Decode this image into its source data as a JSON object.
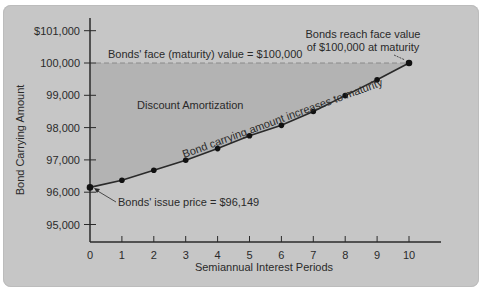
{
  "chart_data": {
    "type": "line",
    "title": "",
    "xlabel": "Semiannual Interest Periods",
    "ylabel": "Bond Carrying Amount",
    "x": [
      0,
      1,
      2,
      3,
      4,
      5,
      6,
      7,
      8,
      9,
      10
    ],
    "x_tick_labels": [
      "0",
      "1",
      "2",
      "3",
      "4",
      "5",
      "6",
      "7",
      "8",
      "9",
      "10"
    ],
    "y_tick_labels": [
      "95,000",
      "96,000",
      "97,000",
      "98,000",
      "99,000",
      "100,000",
      "$101,000"
    ],
    "y_ticks": [
      95000,
      96000,
      97000,
      98000,
      99000,
      100000,
      101000
    ],
    "ylim": [
      94400,
      101400
    ],
    "series": [
      {
        "name": "Bond carrying amount",
        "values": [
          96149,
          96370,
          96680,
          96990,
          97350,
          97750,
          98070,
          98500,
          98990,
          99480,
          100000
        ]
      }
    ],
    "reference_line": {
      "value": 100000,
      "label": "Bonds' face (maturity) value = $100,000",
      "style": "dashed"
    },
    "shaded_region": {
      "label": "Discount Amortization",
      "between": [
        "reference_line",
        "series"
      ]
    },
    "annotations": {
      "issue_price": "Bonds' issue price = $96,149",
      "curve_label": "Bond carrying amount increases to maturity",
      "maturity_line1": "Bonds reach face value",
      "maturity_line2": "of $100,000 at maturity",
      "region_label": "Discount Amortization"
    },
    "grid": false,
    "legend": "none"
  },
  "colors": {
    "background": "#c6c6c6",
    "shaded": "#b3b3b3",
    "axis": "#2a2a2a",
    "line": "#2a2a2a",
    "dashed": "#8a8a8a"
  }
}
